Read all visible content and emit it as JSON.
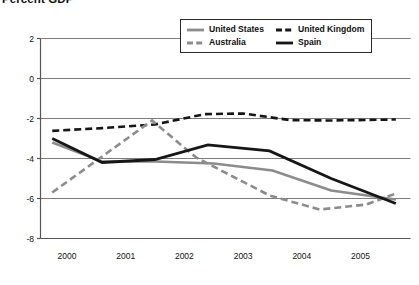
{
  "chart_data": {
    "type": "line",
    "title": "Percent GDP",
    "xlabel": "",
    "ylabel": "",
    "xlim": [
      1999.55,
      2005.85
    ],
    "ylim": [
      -8,
      2
    ],
    "grid": true,
    "grid_axis": "y",
    "legend_position": "top-center-right",
    "y_ticks": [
      2,
      0,
      -2,
      -4,
      -6,
      -8
    ],
    "y_tick_labels": [
      "2",
      "0",
      "-2",
      "-4",
      "-6",
      "-8"
    ],
    "x_ticks": [
      2000,
      2001,
      2002,
      2003,
      2004,
      2005
    ],
    "x_tick_labels": [
      "2000",
      "2001",
      "2002",
      "2003",
      "2004",
      "2005"
    ],
    "series": [
      {
        "name": "United States",
        "color": "#8c8c8c",
        "style": "solid",
        "width": 2.6,
        "points": [
          [
            1999.75,
            -3.2
          ],
          [
            2000.6,
            -4.15
          ],
          [
            2001.5,
            -4.15
          ],
          [
            2002.5,
            -4.25
          ],
          [
            2003.5,
            -4.6
          ],
          [
            2004.5,
            -5.6
          ],
          [
            2005.6,
            -6.05
          ]
        ]
      },
      {
        "name": "United Kingdom",
        "color": "#161616",
        "style": "dashed",
        "width": 2.6,
        "points": [
          [
            1999.75,
            -2.62
          ],
          [
            2000.6,
            -2.48
          ],
          [
            2001.5,
            -2.3
          ],
          [
            2002.35,
            -1.78
          ],
          [
            2003.0,
            -1.75
          ],
          [
            2003.8,
            -2.08
          ],
          [
            2004.5,
            -2.1
          ],
          [
            2005.6,
            -2.05
          ]
        ]
      },
      {
        "name": "Australia",
        "color": "#8c8c8c",
        "style": "dashed",
        "width": 2.6,
        "points": [
          [
            1999.75,
            -5.7
          ],
          [
            2001.45,
            -2.1
          ],
          [
            2002.2,
            -3.95
          ],
          [
            2003.45,
            -5.85
          ],
          [
            2004.3,
            -6.55
          ],
          [
            2005.1,
            -6.3
          ],
          [
            2005.6,
            -5.75
          ]
        ]
      },
      {
        "name": "Spain",
        "color": "#161616",
        "style": "solid",
        "width": 2.8,
        "points": [
          [
            1999.75,
            -3.0
          ],
          [
            2000.6,
            -4.2
          ],
          [
            2001.5,
            -4.05
          ],
          [
            2002.4,
            -3.32
          ],
          [
            2003.45,
            -3.62
          ],
          [
            2004.5,
            -5.0
          ],
          [
            2005.6,
            -6.25
          ]
        ]
      }
    ],
    "legend_entries": [
      {
        "label": "United States",
        "color": "#8c8c8c",
        "style": "solid"
      },
      {
        "label": "United Kingdom",
        "color": "#161616",
        "style": "dashed"
      },
      {
        "label": "Australia",
        "color": "#8c8c8c",
        "style": "dashed"
      },
      {
        "label": "Spain",
        "color": "#161616",
        "style": "solid"
      }
    ],
    "axis_color": "#555555",
    "grid_color": "#7d7d7d",
    "background": "#ffffff"
  }
}
